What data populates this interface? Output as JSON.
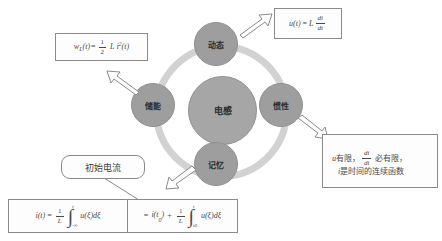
{
  "diagram": {
    "title_center": "电感",
    "nodes": [
      {
        "id": "dynamic",
        "label": "动态",
        "position": "top"
      },
      {
        "id": "energy-storage",
        "label": "储能",
        "position": "left"
      },
      {
        "id": "inertia",
        "label": "惯性",
        "position": "right"
      },
      {
        "id": "memory",
        "label": "记忆",
        "position": "bottom"
      }
    ],
    "colors": {
      "ring": "#d2d2d2",
      "node_fill": "#9e9e9e",
      "center_fill": "#a6a6a6",
      "box_border": "#8a8a8a",
      "arrow_fill": "#ffffff",
      "text": "#3d3d3d"
    }
  },
  "boxes": {
    "voltage": {
      "id": "voltage-formula",
      "formula_text": "u(t) = L di/dt",
      "lhs": "u(t)",
      "equals": "=",
      "coef": "L",
      "num": "di",
      "den": "dt"
    },
    "energy": {
      "id": "energy-formula",
      "formula_text": "wL(t) = 1/2 L i²(t)",
      "lhs": "w",
      "lhs_sub": "L",
      "lhs_arg": "(t)",
      "equals": "=",
      "num": "1",
      "den": "2",
      "coef": "L i",
      "exp": "2",
      "arg": "(t)"
    },
    "continuity": {
      "id": "continuity-note",
      "line1_a": "u",
      "line1_b": "有限，",
      "line1_num": "di",
      "line1_den": "dt",
      "line1_c": "必有限，",
      "line2_a": "i",
      "line2_b": "是时间的连续函数"
    },
    "current": {
      "id": "current-formula",
      "left": {
        "lhs": "i(t)",
        "equals": "=",
        "num": "1",
        "den": "L",
        "int_upper": "t",
        "int_lower": "-∞",
        "integrand": "u(ξ)dξ"
      },
      "right": {
        "equals": "=",
        "term": "i(t",
        "term_sub": "0",
        "term_end": ")",
        "plus": "+",
        "num": "1",
        "den": "L",
        "int_upper": "t",
        "int_lower": "t0",
        "integrand": "u(ξ)dξ"
      }
    }
  },
  "callout": {
    "id": "initial-current-callout",
    "label": "初始电流"
  }
}
